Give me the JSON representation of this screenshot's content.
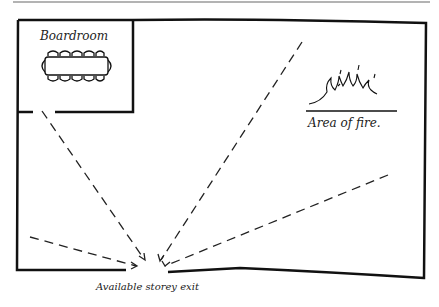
{
  "diagram": {
    "rooms": [
      {
        "label": "Boardroom"
      }
    ],
    "fire_label": "Area of fire.",
    "exit_label": "Available storey exit",
    "routes": [
      {
        "from": "boardroom"
      },
      {
        "from": "top-center"
      },
      {
        "from": "right"
      },
      {
        "from": "left"
      }
    ]
  }
}
